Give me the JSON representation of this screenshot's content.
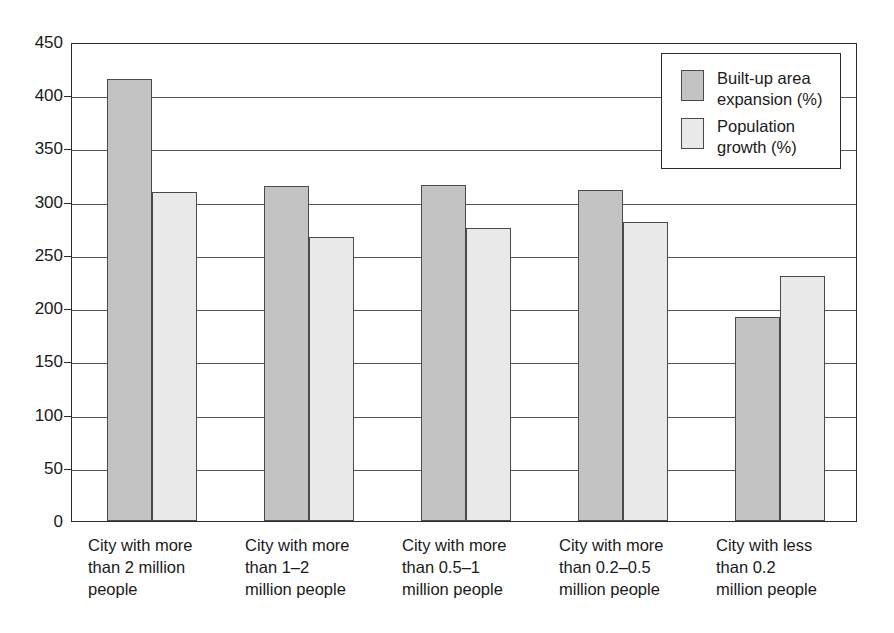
{
  "chart_data": {
    "type": "bar",
    "title": "",
    "subtitle": "",
    "xlabel": "",
    "ylabel": "",
    "ylim": [
      0,
      450
    ],
    "ytick_step": 50,
    "yticks": [
      0,
      50,
      100,
      150,
      200,
      250,
      300,
      350,
      400,
      450
    ],
    "ytick_labels": [
      "0",
      "50",
      "100",
      "150",
      "200",
      "250",
      "300",
      "350",
      "400",
      "450"
    ],
    "grid": "horizontal",
    "legend_position": "top-right",
    "categories": [
      "City with more\nthan 2 million\npeople",
      "City with more\nthan 1–2\nmillion people",
      "City with more\nthan 0.5–1\nmillion people",
      "City with more\nthan 0.2–0.5\nmillion people",
      "City with less\nthan 0.2\nmillion people"
    ],
    "series": [
      {
        "name": "Built-up area\nexpansion (%)",
        "color": "#c3c3c3",
        "values": [
          415,
          315,
          316,
          311,
          192
        ]
      },
      {
        "name": "Population\ngrowth (%)",
        "color": "#e9e9e9",
        "values": [
          309,
          267,
          275,
          281,
          230
        ]
      }
    ]
  },
  "legend": {
    "entries": [
      {
        "label": "Built-up area\nexpansion (%)"
      },
      {
        "label": "Population\ngrowth (%)"
      }
    ]
  }
}
